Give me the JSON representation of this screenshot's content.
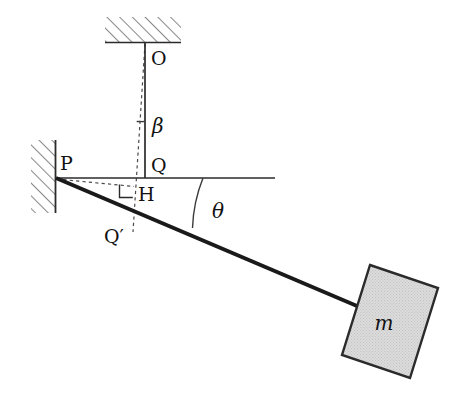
{
  "figure": {
    "background_color": "#ffffff",
    "line_color": "#1a1a1a",
    "dashed_color": "#555555",
    "hatch_color": "#7a7a7a",
    "block_fill": "#d9d9d9",
    "block_stroke": "#2b2b2b",
    "width": 471,
    "height": 417
  },
  "labels": {
    "pivot_O": "O",
    "pivot_P": "P",
    "point_Q": "Q",
    "point_H": "H",
    "point_Qprime": "Q′",
    "angle_beta": "β",
    "angle_theta": "θ",
    "mass": "m"
  },
  "geometry": {
    "ceiling_hatch": {
      "x": 105,
      "y": 17,
      "width": 76,
      "height": 26
    },
    "wall_hatch": {
      "x": 31,
      "y": 140,
      "width": 25,
      "height": 73
    },
    "point_O": {
      "x": 145,
      "y": 43
    },
    "point_P": {
      "x": 56,
      "y": 178
    },
    "point_Q": {
      "x": 145,
      "y": 178
    },
    "point_H": {
      "x": 133,
      "y": 186
    },
    "point_Qprime": {
      "x": 133,
      "y": 230
    },
    "horizontal_line_end": {
      "x": 275,
      "y": 178
    },
    "rod_end": {
      "x": 356,
      "y": 306
    },
    "right_angle_marker": {
      "x": 120,
      "y": 186,
      "size": 13
    },
    "beta_arc_y": 120,
    "theta_arc_start": {
      "x": 203,
      "y": 178
    },
    "theta_arc_end": {
      "x": 192,
      "y": 227
    },
    "block_corners": [
      {
        "x": 370,
        "y": 265
      },
      {
        "x": 438,
        "y": 288
      },
      {
        "x": 410,
        "y": 378
      },
      {
        "x": 342,
        "y": 355
      }
    ]
  },
  "label_positions": {
    "O": {
      "x": 151,
      "y": 65
    },
    "P": {
      "x": 60,
      "y": 170
    },
    "Q": {
      "x": 151,
      "y": 172
    },
    "H": {
      "x": 138,
      "y": 200
    },
    "Qprime": {
      "x": 105,
      "y": 243
    },
    "beta": {
      "x": 151,
      "y": 132
    },
    "theta": {
      "x": 211,
      "y": 217
    },
    "m": {
      "x": 383,
      "y": 329
    }
  }
}
